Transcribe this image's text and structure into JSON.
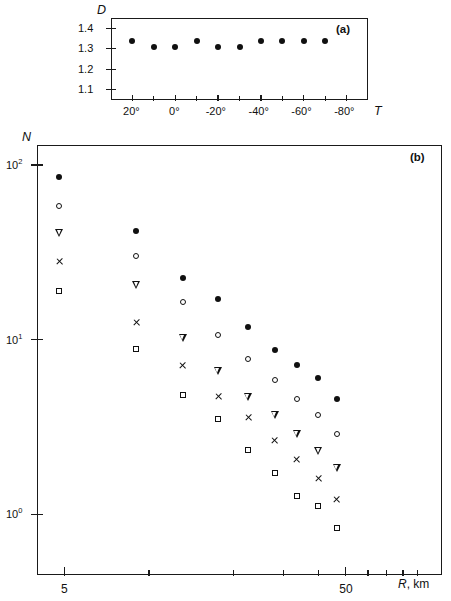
{
  "figure": {
    "panels": [
      {
        "id": "a",
        "label": "(a)",
        "ylabel": "D",
        "xlabel": "T",
        "y_ticks": [
          "1.1",
          "1.2",
          "1.3",
          "1.4"
        ],
        "x_ticks": [
          "20°",
          "0°",
          "-20°",
          "-40°",
          "-60°",
          "-80°"
        ]
      },
      {
        "id": "b",
        "label": "(b)",
        "ylabel": "N",
        "xlabel": "R, km",
        "y_ticks": [
          "10",
          "10"
        ],
        "y_tick_exponents": [
          "2",
          "1",
          "0"
        ],
        "y_tick_labels": [
          "10²",
          "10¹",
          "10⁰"
        ],
        "x_ticks": [
          "5",
          "50"
        ]
      }
    ]
  },
  "chart_data": [
    {
      "type": "scatter",
      "panel": "a",
      "title": "",
      "xlabel": "T",
      "ylabel": "D",
      "xlim": [
        30,
        -90
      ],
      "ylim": [
        1.05,
        1.45
      ],
      "xscale": "linear",
      "yscale": "linear",
      "grid": false,
      "legend": "none",
      "xtick_values": [
        20,
        0,
        -20,
        -40,
        -60,
        -80
      ],
      "xtick_labels": [
        "20°",
        "0°",
        "-20°",
        "-40°",
        "-60°",
        "-80°"
      ],
      "xminor_values": [
        10,
        -10,
        -30,
        -50,
        -70
      ],
      "ytick_values": [
        1.1,
        1.2,
        1.3,
        1.4
      ],
      "ytick_labels": [
        "1.1",
        "1.2",
        "1.3",
        "1.4"
      ],
      "series": [
        {
          "name": "D",
          "marker": "filled-circle",
          "x": [
            20,
            10,
            0,
            -10,
            -20,
            -30,
            -40,
            -50,
            -60,
            -70
          ],
          "y": [
            1.34,
            1.31,
            1.31,
            1.34,
            1.31,
            1.31,
            1.34,
            1.34,
            1.34,
            1.34
          ]
        }
      ]
    },
    {
      "type": "scatter",
      "panel": "b",
      "title": "",
      "xlabel": "R, km",
      "ylabel": "N",
      "xscale": "log",
      "yscale": "log",
      "xlim": [
        4.0,
        110
      ],
      "ylim": [
        0.45,
        130
      ],
      "grid": false,
      "legend": "none",
      "xtick_values": [
        5,
        10,
        20,
        30,
        40,
        50,
        60,
        70,
        80,
        90
      ],
      "xtick_labeled": [
        5,
        50
      ],
      "xtick_labels": [
        "5",
        "50"
      ],
      "ytick_values": [
        100,
        10,
        1
      ],
      "ytick_labels": [
        "10²",
        "10¹",
        "10⁰"
      ],
      "r_values": [
        4.8,
        9.0,
        13.2,
        17.6,
        22.5,
        28.0,
        33.5,
        40.0,
        46.5
      ],
      "series": [
        {
          "name": "series-1",
          "marker": "filled-circle",
          "x": [
            4.8,
            9.0,
            13.2,
            17.6,
            22.5,
            28.0,
            33.5,
            40.0,
            46.5
          ],
          "y": [
            85.0,
            42.0,
            22.5,
            17.0,
            11.8,
            8.7,
            7.2,
            6.0,
            4.6
          ]
        },
        {
          "name": "series-2",
          "marker": "open-circle",
          "x": [
            4.8,
            9.0,
            13.2,
            17.6,
            22.5,
            28.0,
            33.5,
            40.0,
            46.5
          ],
          "y": [
            58.0,
            30.0,
            16.5,
            10.6,
            7.7,
            5.9,
            4.6,
            3.7,
            2.9
          ]
        },
        {
          "name": "series-3",
          "marker": "triangle-down",
          "x": [
            4.8,
            9.0,
            13.2,
            17.6,
            22.5,
            28.0,
            33.5,
            40.0,
            46.5
          ],
          "y": [
            41.0,
            20.5,
            10.2,
            6.6,
            4.7,
            3.7,
            2.9,
            2.3,
            1.85
          ]
        },
        {
          "name": "series-4",
          "marker": "cross",
          "x": [
            4.8,
            9.0,
            13.2,
            17.6,
            22.5,
            28.0,
            33.5,
            40.0,
            46.5
          ],
          "y": [
            28.0,
            12.6,
            7.1,
            4.7,
            3.6,
            2.65,
            2.05,
            1.6,
            1.22
          ]
        },
        {
          "name": "series-5",
          "marker": "open-square",
          "x": [
            4.8,
            9.0,
            13.2,
            17.6,
            22.5,
            28.0,
            33.5,
            40.0,
            46.5
          ],
          "y": [
            19.0,
            8.8,
            4.8,
            3.5,
            2.35,
            1.72,
            1.28,
            1.12,
            0.84
          ]
        }
      ]
    }
  ]
}
